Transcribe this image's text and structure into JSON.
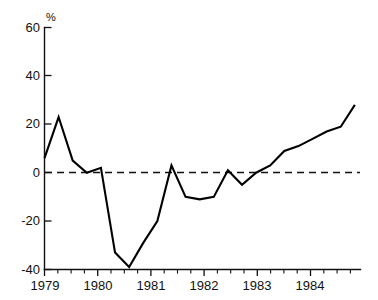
{
  "chart_data": {
    "type": "line",
    "title": "",
    "subtitle": "",
    "xlabel": "",
    "ylabel": "%",
    "unit_label": "%",
    "xlim": [
      1979.0,
      1984.6
    ],
    "ylim": [
      -40,
      60
    ],
    "ytick_values": [
      60,
      40,
      20,
      0,
      -20,
      -40
    ],
    "ytick_labels": [
      "60",
      "40",
      "20",
      "0",
      "-20",
      "-40"
    ],
    "xtick_values": [
      1979,
      1980,
      1981,
      1982,
      1983,
      1984
    ],
    "xtick_labels": [
      "1979",
      "1980",
      "1981",
      "1982",
      "1983",
      "1984"
    ],
    "minor_xticks_per_year": 4,
    "grid": false,
    "legend": null,
    "zero_reference_line": {
      "value": 0,
      "style": "dashed"
    },
    "series": [
      {
        "name": "percent change",
        "x": [
          1979.0,
          1979.25,
          1979.5,
          1979.75,
          1980.0,
          1980.25,
          1980.5,
          1980.75,
          1981.0,
          1981.25,
          1981.5,
          1981.75,
          1982.0,
          1982.25,
          1982.5,
          1982.75,
          1983.0,
          1983.25,
          1983.5,
          1983.75,
          1984.0,
          1984.25,
          1984.5
        ],
        "values": [
          6,
          23,
          5,
          0,
          2,
          -33,
          -39,
          -29,
          -20,
          3,
          -10,
          -11,
          -10,
          1,
          -5,
          0,
          3,
          9,
          11,
          14,
          17,
          19,
          28
        ]
      }
    ]
  },
  "axes": {
    "y_axis_name": "percent-axis",
    "x_axis_name": "year-axis"
  }
}
